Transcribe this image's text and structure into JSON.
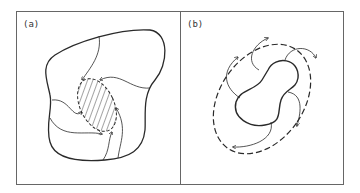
{
  "figure": {
    "panels": [
      {
        "id": "a",
        "label": "(a)",
        "description": "Irregular closed region with hatched elliptical core bounded by dashed arrowed curve; curved flow lines from outer boundary spiral into core"
      },
      {
        "id": "b",
        "label": "(b)",
        "description": "Peanut-shaped solid closed curve inside a dashed elliptical boundary with arrows; curved flow lines spiral between inner curve and outer dashed boundary"
      }
    ],
    "colors": {
      "stroke": "#2a2a2a",
      "border": "#555555",
      "background": "#ffffff"
    }
  }
}
